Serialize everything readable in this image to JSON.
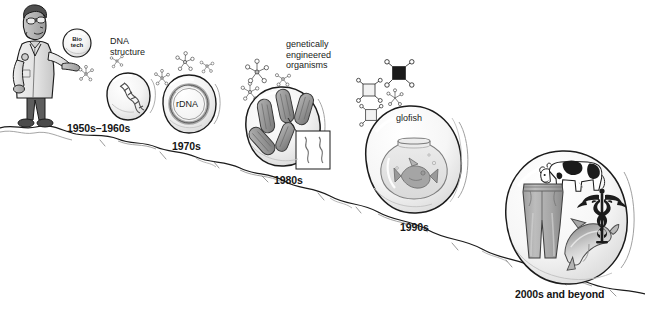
{
  "figure": {
    "domain": "diagram",
    "background_color": "#ffffff",
    "ink_color": "#141414",
    "fill_light": "#f2f2f2",
    "fill_mid": "#c9c9c9",
    "fill_dark": "#8d8d8d"
  },
  "scientist": {
    "name": "scientist-figure",
    "bubble_line1": "Bio",
    "bubble_line2": "tech"
  },
  "milestones": [
    {
      "id": "dna-structure",
      "era_label": "1950s–1960s",
      "caption_lines": [
        "DNA",
        "structure"
      ],
      "inner_label": "",
      "icon": "dna-helix-icon"
    },
    {
      "id": "rdna",
      "era_label": "1970s",
      "caption_lines": [],
      "inner_label": "rDNA",
      "icon": "plasmid-ring-icon"
    },
    {
      "id": "geo",
      "era_label": "1980s",
      "caption_lines": [
        "genetically",
        "engineered",
        "organisms"
      ],
      "inner_label": "",
      "icon": "bacteria-icon"
    },
    {
      "id": "glofish",
      "era_label": "1990s",
      "caption_lines": [],
      "inner_label": "glofish",
      "icon": "fishbowl-icon"
    },
    {
      "id": "future",
      "era_label": "2000s and beyond",
      "caption_lines": [],
      "inner_label": "",
      "icon": "cow-jeans-dolphin-caduceus-icon"
    }
  ]
}
